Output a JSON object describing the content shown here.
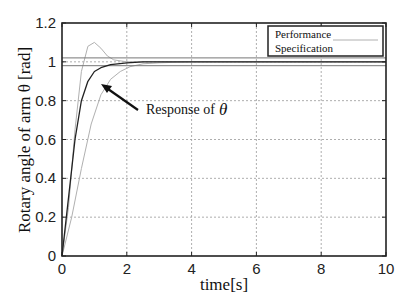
{
  "chart_data": {
    "type": "line",
    "title": "",
    "xlabel": "time[s]",
    "ylabel": "Rotary angle of arm θ [rad]",
    "xlim": [
      0,
      10
    ],
    "ylim": [
      0,
      1.2
    ],
    "xticks": [
      0,
      2,
      4,
      6,
      8,
      10
    ],
    "yticks": [
      0,
      0.2,
      0.4,
      0.6,
      0.8,
      1,
      1.2
    ],
    "xtick_labels": [
      "0",
      "2",
      "4",
      "6",
      "8",
      "10"
    ],
    "ytick_labels": [
      "0",
      "0.2",
      "0.4",
      "0.6",
      "0.8",
      "1",
      "1.2"
    ],
    "grid": true,
    "legend_position": "upper right",
    "legend": [
      "Performance",
      "Specification"
    ],
    "annotation": {
      "text": "Response of",
      "symbol": "θ"
    },
    "series": [
      {
        "name": "Response of θ",
        "color": "#222222",
        "x": [
          0,
          0.2,
          0.4,
          0.6,
          0.8,
          1.0,
          1.2,
          1.5,
          2.0,
          2.5,
          3.0,
          4.0,
          10.0
        ],
        "y": [
          0,
          0.3,
          0.6,
          0.8,
          0.9,
          0.95,
          0.97,
          0.985,
          0.995,
          1.0,
          1.0,
          1.0,
          1.0
        ]
      },
      {
        "name": "Performance specification (upper, overshoot)",
        "color": "#b0b0b0",
        "x": [
          0,
          0.2,
          0.4,
          0.6,
          0.8,
          1.0,
          1.2,
          1.4,
          1.6,
          2.0,
          2.5,
          3.0,
          10.0
        ],
        "y": [
          0,
          0.25,
          0.65,
          0.95,
          1.08,
          1.1,
          1.07,
          1.03,
          1.01,
          1.0,
          1.0,
          1.0,
          1.0
        ]
      },
      {
        "name": "Performance specification (lower, slow)",
        "color": "#b0b0b0",
        "x": [
          0,
          0.3,
          0.6,
          0.9,
          1.2,
          1.5,
          1.8,
          2.1,
          2.5,
          3.0,
          4.0,
          10.0
        ],
        "y": [
          0,
          0.2,
          0.45,
          0.68,
          0.83,
          0.91,
          0.95,
          0.975,
          0.99,
          0.995,
          1.0,
          1.0
        ]
      },
      {
        "name": "Specification band upper",
        "color": "#777777",
        "x": [
          0,
          10
        ],
        "y": [
          1.02,
          1.02
        ]
      },
      {
        "name": "Specification band lower",
        "color": "#777777",
        "x": [
          0,
          10
        ],
        "y": [
          0.98,
          0.98
        ]
      }
    ]
  }
}
